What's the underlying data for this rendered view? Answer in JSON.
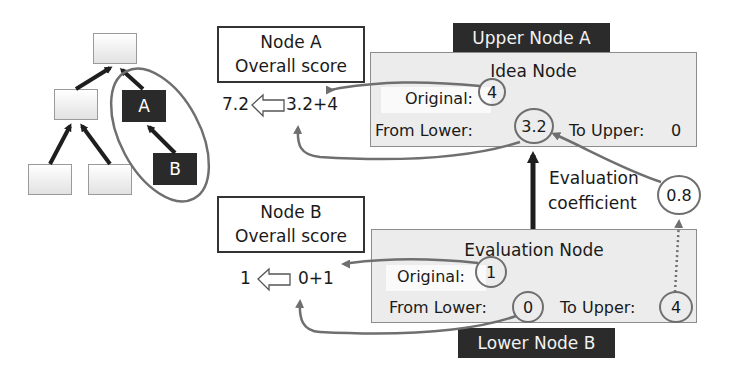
{
  "tree": {
    "node_a_label": "A",
    "node_b_label": "B"
  },
  "node_a_card": {
    "line1": "Node A",
    "line2": "Overall score",
    "result": "7.2",
    "formula": "3.2+4"
  },
  "node_b_card": {
    "line1": "Node B",
    "line2": "Overall score",
    "result": "1",
    "formula": "0+1"
  },
  "upper_node": {
    "tag": "Upper Node A",
    "title": "Idea Node",
    "original_label": "Original:",
    "original_value": "4",
    "from_lower_label": "From Lower:",
    "from_lower_value": "3.2",
    "to_upper_label": "To Upper:",
    "to_upper_value": "0"
  },
  "coefficient": {
    "line1": "Evaluation",
    "line2": "coefficient",
    "value": "0.8",
    "multiply_symbol": "X"
  },
  "lower_node": {
    "tag": "Lower Node B",
    "title": "Evaluation Node",
    "original_label": "Original:",
    "original_value": "1",
    "from_lower_label": "From Lower:",
    "from_lower_value": "0",
    "to_upper_label": "To Upper:",
    "to_upper_value": "4"
  },
  "colors": {
    "dark_fill": "#2b2b2b",
    "panel_fill": "#ececec",
    "connector": "#6f6f6f",
    "tree_arrow": "#1e1e1e"
  }
}
